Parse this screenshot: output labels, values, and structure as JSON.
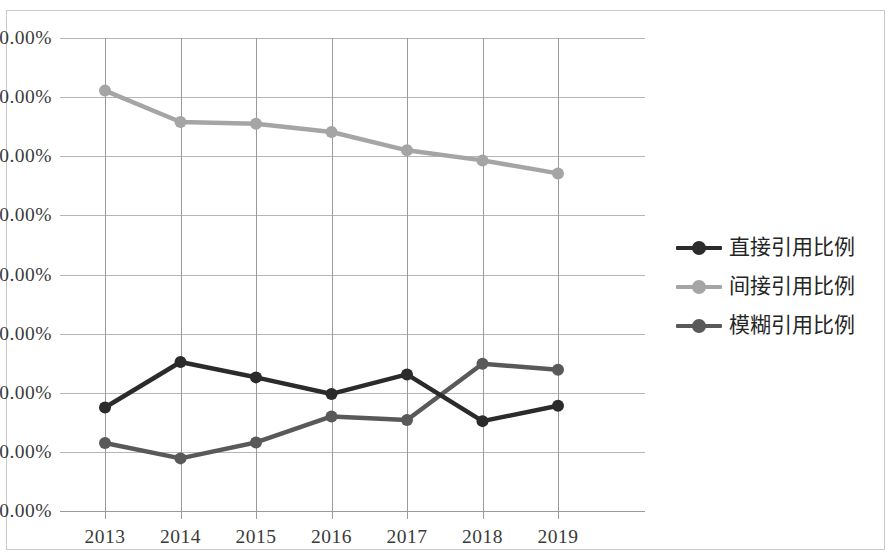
{
  "chart_data": {
    "type": "line",
    "title": "",
    "xlabel": "",
    "ylabel": "",
    "categories": [
      "2013",
      "2014",
      "2015",
      "2016",
      "2017",
      "2018",
      "2019"
    ],
    "x_tick_labels": [
      "2013",
      "2014",
      "2015",
      "2016",
      "2017",
      "2018",
      "2019"
    ],
    "y_tick_labels": [
      "80.00%",
      "70.00%",
      "60.00%",
      "50.00%",
      "40.00%",
      "30.00%",
      "20.00%",
      "10.00%",
      "0.00%"
    ],
    "y_tick_values": [
      80,
      70,
      60,
      50,
      40,
      30,
      20,
      10,
      0
    ],
    "ylim": [
      0,
      80
    ],
    "y_unit": "%",
    "grid": "horizontal-and-vertical",
    "legend_position": "right",
    "series": [
      {
        "name": "直接引用比例",
        "color": "#2b2b2b",
        "values": [
          17.5,
          25.2,
          22.6,
          19.8,
          23.1,
          15.2,
          17.8
        ]
      },
      {
        "name": "间接引用比例",
        "color": "#a5a5a5",
        "values": [
          71.1,
          65.8,
          65.5,
          64.1,
          61.0,
          59.3,
          57.1
        ]
      },
      {
        "name": "模糊引用比例",
        "color": "#595959",
        "values": [
          11.5,
          8.9,
          11.6,
          16.0,
          15.4,
          24.9,
          23.9
        ]
      }
    ]
  },
  "legend": {
    "items": [
      {
        "label": "直接引用比例",
        "color": "#2b2b2b"
      },
      {
        "label": "间接引用比例",
        "color": "#a5a5a5"
      },
      {
        "label": "模糊引用比例",
        "color": "#595959"
      }
    ]
  },
  "colors": {
    "gridline": "#b6b6b6",
    "axis": "#9a9a9a",
    "frame_border": "#c9c9c9",
    "tick_text": "#3a3a3a",
    "background": "#ffffff"
  }
}
